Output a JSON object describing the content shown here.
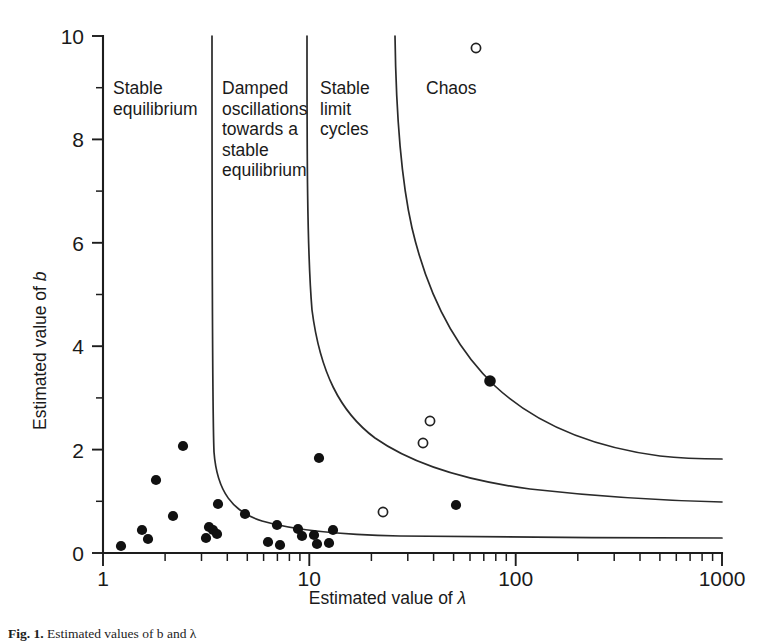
{
  "figure": {
    "caption_label": "Fig. 1.",
    "caption_text": "Estimated values of b and λ"
  },
  "chart_data": {
    "type": "scatter",
    "title": "",
    "xlabel": "Estimated value of λ",
    "ylabel": "Estimated value of b",
    "xscale": "log",
    "yscale": "linear",
    "xlim": [
      1,
      1000
    ],
    "ylim": [
      0,
      10
    ],
    "grid": false,
    "legend": "none",
    "xticks_major": [
      1,
      10,
      100,
      1000
    ],
    "xtick_labels": [
      "1",
      "10",
      "100",
      "1000"
    ],
    "yticks_major": [
      0,
      2,
      4,
      6,
      8,
      10
    ],
    "ytick_labels": [
      "0",
      "2",
      "4",
      "6",
      "8",
      "10"
    ],
    "yticks_minor": [
      1,
      3,
      5,
      7,
      9
    ],
    "series": [
      {
        "name": "filled-points",
        "marker": "filled-circle",
        "color": "#111111",
        "points": [
          [
            1.22,
            0.14
          ],
          [
            1.55,
            0.44
          ],
          [
            1.65,
            0.27
          ],
          [
            1.8,
            1.42
          ],
          [
            2.15,
            0.72
          ],
          [
            2.45,
            2.07
          ],
          [
            3.15,
            0.28
          ],
          [
            3.25,
            0.5
          ],
          [
            3.4,
            0.44
          ],
          [
            3.55,
            0.37
          ],
          [
            3.6,
            0.95
          ],
          [
            4.9,
            0.76
          ],
          [
            6.3,
            0.3
          ],
          [
            7.0,
            0.54
          ],
          [
            7.2,
            0.16
          ],
          [
            8.8,
            0.47
          ],
          [
            9.2,
            0.34
          ],
          [
            10.4,
            0.35
          ],
          [
            10.8,
            0.18
          ],
          [
            11.0,
            1.83
          ],
          [
            12.3,
            0.19
          ],
          [
            12.8,
            0.44
          ],
          [
            57.0,
            0.93
          ],
          [
            80.0,
            3.32
          ]
        ]
      },
      {
        "name": "open-points",
        "marker": "open-circle",
        "color": "#ffffff",
        "points": [
          [
            22.5,
            0.78
          ],
          [
            35.0,
            2.13
          ],
          [
            38.0,
            2.55
          ],
          [
            70.0,
            9.8
          ]
        ]
      }
    ],
    "regions": [
      {
        "name": "stable-equilibrium",
        "label": "Stable\nequilibrium"
      },
      {
        "name": "damped-oscillations",
        "label": "Damped\noscillations\ntowards a\nstable\nequilibrium"
      },
      {
        "name": "stable-limit-cycles",
        "label": "Stable\nlimit\ncycles"
      },
      {
        "name": "chaos",
        "label": "Chaos"
      }
    ],
    "boundaries": [
      {
        "name": "equilibrium-damped-boundary",
        "description": "near-vertical asymptote at lambda approx 3.4 curving right along b approx 0.9"
      },
      {
        "name": "damped-limitcycle-boundary",
        "description": "asymptote at lambda approx 11 curving right toward b approx 2.0"
      },
      {
        "name": "limitcycle-chaos-boundary",
        "description": "asymptote at lambda approx 22 curving right toward b approx 3.0"
      }
    ]
  }
}
